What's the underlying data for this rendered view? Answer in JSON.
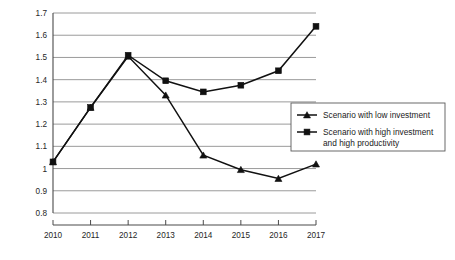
{
  "chart_data": {
    "type": "line",
    "title": "",
    "subtitle": "",
    "xlabel": "",
    "ylabel": "",
    "categories": [
      "2010",
      "2011",
      "2012",
      "2013",
      "2014",
      "2015",
      "2016",
      "2017"
    ],
    "x": [
      2010,
      2011,
      2012,
      2013,
      2014,
      2015,
      2016,
      2017
    ],
    "xlim": [
      2010,
      2017
    ],
    "ylim": [
      0.8,
      1.7
    ],
    "ytick_values": [
      0.8,
      0.9,
      1.0,
      1.1,
      1.2,
      1.3,
      1.4,
      1.5,
      1.6,
      1.7
    ],
    "ytick_labels": [
      "0.8",
      "0.9",
      "1",
      "1.1",
      "1.2",
      "1.3",
      "1.4",
      "1.5",
      "1.6",
      "1.7"
    ],
    "xtick_labels": [
      "2010",
      "2011",
      "2012",
      "2013",
      "2014",
      "2015",
      "2016",
      "2017"
    ],
    "grid": true,
    "grid_axis": "y",
    "legend_position": "right",
    "series": [
      {
        "name": "Scenario with low investment",
        "marker": "triangle",
        "color": "#111111",
        "values": [
          1.03,
          1.275,
          1.505,
          1.33,
          1.06,
          0.995,
          0.955,
          1.02
        ]
      },
      {
        "name": "Scenario with high investment and high productivity",
        "marker": "square",
        "color": "#111111",
        "values": [
          1.03,
          1.275,
          1.51,
          1.395,
          1.345,
          1.375,
          1.44,
          1.64
        ]
      }
    ]
  },
  "legend": {
    "entries": [
      {
        "label": "Scenario with low investment",
        "label_line2": "",
        "marker": "triangle"
      },
      {
        "label": "Scenario with high investment",
        "label_line2": "and high productivity",
        "marker": "square"
      }
    ]
  },
  "colors": {
    "grid": "#8f8f8f",
    "axis": "#4a4a4a",
    "series": "#111111",
    "background": "#ffffff",
    "legend_border": "#5a5a5a"
  }
}
